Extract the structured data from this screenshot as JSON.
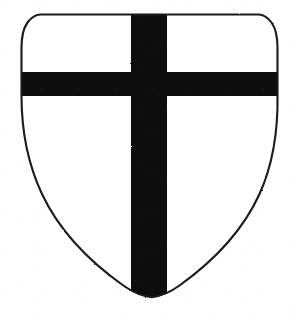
{
  "image": {
    "title": "Heraldic shield with cross",
    "subject": "escutcheon",
    "style": "line engraving, black and white",
    "width_px": 295,
    "height_px": 319
  },
  "palette": {
    "background": "#fefefe",
    "field": "#ffffff",
    "charge": "#0d0d0d",
    "outline": "#1a1a1a"
  },
  "blazon": {
    "field_tincture": "Argent",
    "charge_name": "cross",
    "charge_tincture": "Sable",
    "description": "Argent, a cross sable"
  },
  "geometry": {
    "shield_path": "M 40.5 14.5 C 36.5 14.6 32.0 16.5 27.5 22.5 C 23.5 28.0 21.5 36.0 21.5 48.0 L 21.5 96.0 C 21.5 130.0 27.0 162.0 42.0 194.0 C 57.0 226.0 83.0 257.0 124.0 286.0 C 133.0 292.3 143.0 296.3 151.8 297.3 C 160.5 296.3 170.5 292.0 179.5 285.5 C 220.0 256.5 245.0 226.0 259.5 194.0 C 274.0 162.0 278.0 130.0 277.5 96.0 L 277.5 48.0 C 277.5 36.0 275.5 28.0 271.5 22.5 C 267.0 16.5 262.5 14.6 258.5 14.5 Z",
    "fess_rect": {
      "x": 18,
      "y": 72,
      "width": 262,
      "height": 24
    },
    "pale_rect": {
      "x": 131,
      "y": 10,
      "width": 36,
      "height": 290
    },
    "outline_stroke_width": 2.1
  },
  "elements": {
    "shield_outline_label": "shield-outline",
    "field_label": "shield-field",
    "cross_horizontal_label": "cross-horizontal-bar",
    "cross_vertical_label": "cross-vertical-bar"
  }
}
